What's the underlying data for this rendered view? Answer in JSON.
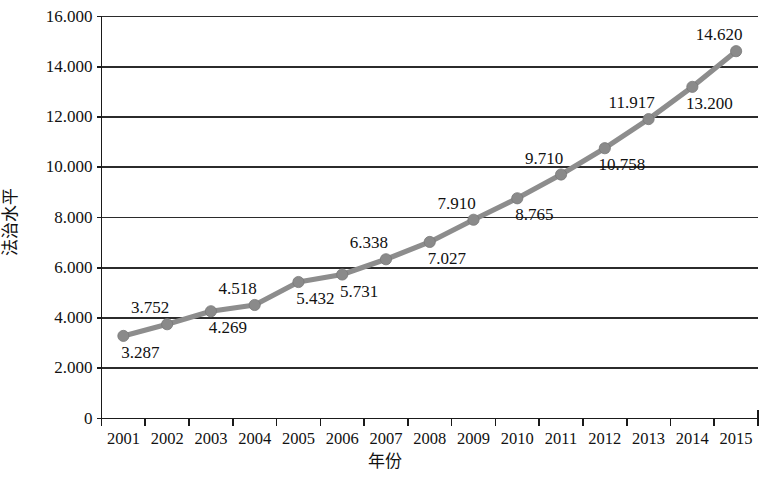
{
  "chart_data": {
    "type": "line",
    "title": "",
    "xlabel": "年份",
    "ylabel": "法治水平",
    "categories": [
      "2001",
      "2002",
      "2003",
      "2004",
      "2005",
      "2006",
      "2007",
      "2008",
      "2009",
      "2010",
      "2011",
      "2012",
      "2013",
      "2014",
      "2015"
    ],
    "values": [
      3.287,
      3.752,
      4.269,
      4.518,
      5.432,
      5.731,
      6.338,
      7.027,
      7.91,
      8.765,
      9.71,
      10.758,
      11.917,
      13.2,
      14.62
    ],
    "point_labels": [
      "3.287",
      "3.752",
      "4.269",
      "4.518",
      "5.432",
      "5.731",
      "6.338",
      "7.027",
      "7.910",
      "8.765",
      "9.710",
      "10.758",
      "11.917",
      "13.200",
      "14.620"
    ],
    "label_positions": [
      "below",
      "above",
      "below",
      "above",
      "below",
      "below",
      "above",
      "below",
      "above",
      "below",
      "above",
      "below",
      "above",
      "below",
      "above"
    ],
    "ylim": [
      0,
      16
    ],
    "ytick_values": [
      0,
      2,
      4,
      6,
      8,
      10,
      12,
      14,
      16
    ],
    "ytick_labels": [
      "0",
      "2.000",
      "4.000",
      "6.000",
      "8.000",
      "10.000",
      "12.000",
      "14.000",
      "16.000"
    ],
    "grid": "horizontal",
    "legend": "none",
    "series_name": "法治水平",
    "line_color": "#8d8d8d",
    "marker_color": "#8a8a8a",
    "marker_shape": "circle",
    "axis_color": "#1a1a1a",
    "grid_color": "#2b2b2b",
    "background": "#ffffff"
  }
}
